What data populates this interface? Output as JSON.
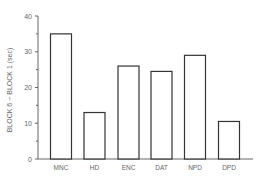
{
  "chart_data": {
    "type": "bar",
    "title": "",
    "xlabel": "",
    "ylabel": "BLOCK 6 − BLOCK 1 (sec)",
    "categories": [
      "MNC",
      "HD",
      "ENC",
      "DAT",
      "NPD",
      "DPD"
    ],
    "values": [
      35,
      13,
      26,
      24.5,
      29,
      10.5
    ],
    "ylim": [
      0,
      40
    ],
    "yticks": [
      0,
      10,
      20,
      30,
      40
    ],
    "grid": false,
    "legend": null
  },
  "colors": {
    "axis": "#666666",
    "bar_stroke": "#333333",
    "bar_fill": "#ffffff",
    "text": "#666666"
  }
}
